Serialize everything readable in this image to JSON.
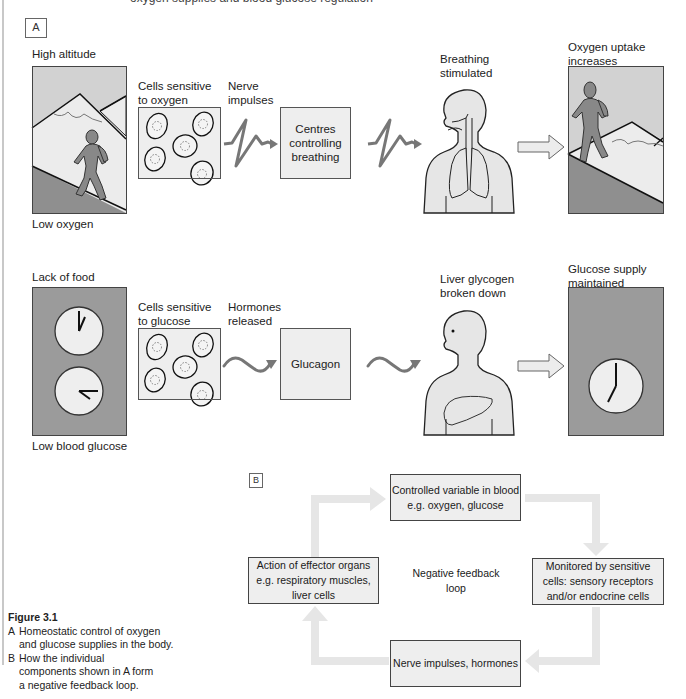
{
  "header": {
    "clipped_text": "oxygen supplies and blood glucose regulation"
  },
  "panel_a": {
    "tag": "A",
    "row_oxygen": {
      "stimulus_top": "High altitude",
      "stimulus_bottom": "Low oxygen",
      "sensors_label": [
        "Cells sensitive",
        "to oxygen"
      ],
      "signal_label": [
        "Nerve",
        "impulses"
      ],
      "controller_label": [
        "Centres",
        "controlling",
        "breathing"
      ],
      "effector_label": [
        "Breathing",
        "stimulated"
      ],
      "outcome_label": [
        "Oxygen uptake",
        "increases"
      ],
      "icons": {
        "stimulus": "mountain-climber-icon",
        "sensors": "cells-icon",
        "signal": "nerve-impulse-zigzag-icon",
        "effector": "human-lungs-icon",
        "outcome": "mountain-climber-icon"
      }
    },
    "row_glucose": {
      "stimulus_top": "Lack of food",
      "stimulus_bottom": "Low blood glucose",
      "sensors_label": [
        "Cells sensitive",
        "to glucose"
      ],
      "signal_label": [
        "Hormones",
        "released"
      ],
      "controller_label": [
        "Glucagon"
      ],
      "effector_label": [
        "Liver glycogen",
        "broken down"
      ],
      "outcome_label": [
        "Glucose supply",
        "maintained"
      ],
      "icons": {
        "stimulus": "two-clocks-icon",
        "sensors": "cells-icon",
        "signal": "hormone-wave-icon",
        "effector": "human-liver-icon",
        "outcome": "clock-icon"
      }
    }
  },
  "panel_b": {
    "tag": "B",
    "center_label": [
      "Negative feedback",
      "loop"
    ],
    "boxes": {
      "top": [
        "Controlled variable in blood",
        "e.g. oxygen, glucose"
      ],
      "right": [
        "Monitored by sensitive",
        "cells: sensory receptors",
        "and/or endocrine cells"
      ],
      "bottom": [
        "Nerve impulses, hormones"
      ],
      "left": [
        "Action of effector organs",
        "e.g. respiratory muscles,",
        "liver cells"
      ]
    },
    "arrow_color": "#e6e6e6"
  },
  "caption": {
    "title": "Figure 3.1",
    "items": [
      {
        "key": "A",
        "lines": [
          "Homeostatic control of oxygen",
          "and glucose supplies in the body."
        ]
      },
      {
        "key": "B",
        "lines": [
          "How the individual",
          "components shown in A form",
          "a negative feedback loop."
        ]
      }
    ]
  },
  "colors": {
    "panel_light": "#eeeeee",
    "panel_dark": "#9b9b9b",
    "sky": "#d2d2d2",
    "figure": "#8a8a8a",
    "outline": "#333333",
    "signal": "#777777"
  }
}
